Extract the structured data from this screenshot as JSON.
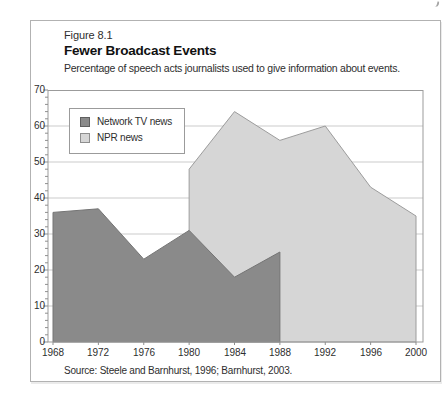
{
  "page": {
    "corner_mark": "partial-page-number-mark"
  },
  "figure": {
    "label": "Figure 8.1",
    "title": "Fewer Broadcast Events",
    "subtitle": "Percentage of speech acts journalists used to give information about events.",
    "source": "Source: Steele and Barnhurst, 1996; Barnhurst, 2003."
  },
  "legend": {
    "position": "top-left-inside",
    "items": [
      {
        "label": "Network TV news",
        "color": "#8a8a8a",
        "border": "#5f5f5f"
      },
      {
        "label": "NPR news",
        "color": "#d6d6d6",
        "border": "#8e8e8e"
      }
    ]
  },
  "chart_data": {
    "type": "area",
    "title": "Fewer Broadcast Events",
    "xlabel": "",
    "ylabel": "",
    "xlim": [
      1968,
      2000
    ],
    "ylim": [
      0,
      70
    ],
    "grid": "horizontal",
    "grid_step": 10,
    "y_minor_tick_step": 2,
    "x_tick_values": [
      1968,
      1972,
      1976,
      1980,
      1984,
      1988,
      1992,
      1996,
      2000
    ],
    "x_tick_labels": [
      "1968",
      "1972",
      "1976",
      "1980",
      "1984",
      "1988",
      "1992",
      "1996",
      "2000"
    ],
    "y_tick_values": [
      70,
      60,
      50,
      40,
      30,
      20,
      10,
      0
    ],
    "y_tick_labels": [
      "70",
      "60",
      "50",
      "40",
      "30",
      "20",
      "10",
      "0"
    ],
    "series": [
      {
        "name": "Network TV news",
        "x": [
          1968,
          1972,
          1976,
          1980,
          1984,
          1988
        ],
        "values": [
          36,
          37,
          23,
          31,
          18,
          25
        ],
        "fill": "#8a8a8a",
        "stroke": "#747474",
        "baseline": 0,
        "z_order": "front"
      },
      {
        "name": "NPR news",
        "x": [
          1980,
          1984,
          1988,
          1992,
          1996,
          2000
        ],
        "values": [
          48,
          64,
          56,
          60,
          43,
          35
        ],
        "fill": "#d6d6d6",
        "stroke": "#9c9c9c",
        "baseline": 0,
        "z_order": "back"
      }
    ],
    "colors": {
      "gridline": "#cbcbcb",
      "plot_border": "#9b9b9b",
      "tick": "#8f8f8f",
      "text": "#2e2e2e"
    }
  }
}
